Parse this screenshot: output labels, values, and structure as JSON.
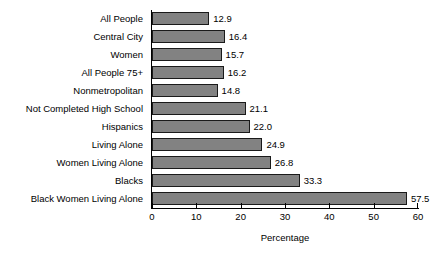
{
  "chart_data": {
    "type": "bar",
    "orientation": "horizontal",
    "title": "",
    "xlabel": "Percentage",
    "ylabel": "",
    "xlim": [
      0,
      60
    ],
    "xticks": [
      0,
      10,
      20,
      30,
      40,
      50,
      60
    ],
    "grid": false,
    "legend": false,
    "bar_color": "#828282",
    "bar_edge_color": "#1a1a1a",
    "categories": [
      "All People",
      "Central City",
      "Women",
      "All People 75+",
      "Nonmetropolitan",
      "Not Completed High School",
      "Hispanics",
      "Living Alone",
      "Women Living Alone",
      "Blacks",
      "Black Women Living Alone"
    ],
    "values": [
      12.9,
      16.4,
      15.7,
      16.2,
      14.8,
      21.1,
      22.0,
      24.9,
      26.8,
      33.3,
      57.5
    ],
    "value_labels": [
      "12.9",
      "16.4",
      "15.7",
      "16.2",
      "14.8",
      "21.1",
      "22.0",
      "24.9",
      "26.8",
      "33.3",
      "57.5"
    ],
    "tick_labels": [
      "0",
      "10",
      "20",
      "30",
      "40",
      "50",
      "60"
    ]
  }
}
